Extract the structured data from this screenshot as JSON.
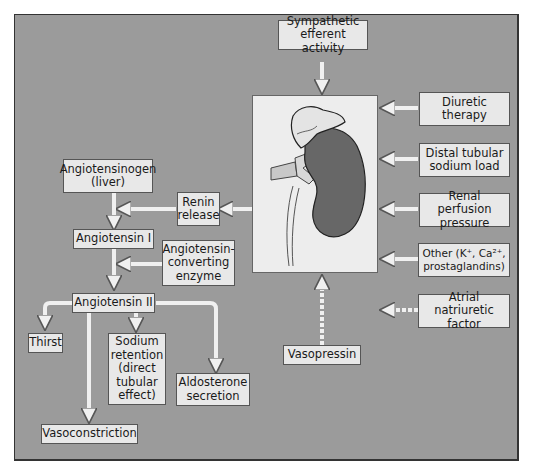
{
  "diagram": {
    "colors": {
      "background": "#9b9b9b",
      "box_fill": "#e8e8e8",
      "kidney_cortex": "#666666",
      "kidney_panel": "#ededed"
    },
    "nodes": {
      "sympathetic": "Sympathetic\nefferent activity",
      "diuretic": "Diuretic\ntherapy",
      "distal": "Distal tubular\nsodium load",
      "perfusion": "Renal perfusion\npressure",
      "other": "Other (K⁺, Ca²⁺,\nprostaglandins)",
      "anf": "Atrial natriuretic\nfactor",
      "vasopressin": "Vasopressin",
      "renin": "Renin\nrelease",
      "angiotensinogen": "Angiotensinogen\n(liver)",
      "ang1": "Angiotensin I",
      "ace": "Angiotensin-\nconverting\nenzyme",
      "ang2": "Angiotensin II",
      "thirst": "Thirst",
      "sodium": "Sodium\nretention\n(direct\ntubular\neffect)",
      "aldosterone": "Aldosterone\nsecretion",
      "vasoconstriction": "Vasoconstriction"
    },
    "edges": [
      {
        "from": "sympathetic",
        "to": "kidney",
        "style": "solid"
      },
      {
        "from": "diuretic",
        "to": "kidney",
        "style": "solid"
      },
      {
        "from": "distal",
        "to": "kidney",
        "style": "solid"
      },
      {
        "from": "perfusion",
        "to": "kidney",
        "style": "solid"
      },
      {
        "from": "other",
        "to": "kidney",
        "style": "solid"
      },
      {
        "from": "anf",
        "to": "kidney",
        "style": "dashed"
      },
      {
        "from": "vasopressin",
        "to": "kidney",
        "style": "dashed"
      },
      {
        "from": "kidney",
        "to": "renin",
        "style": "solid"
      },
      {
        "from": "renin",
        "to": "angiotensinogen-ang1",
        "style": "solid"
      },
      {
        "from": "angiotensinogen",
        "to": "ang1",
        "style": "solid"
      },
      {
        "from": "ace",
        "to": "ang1-ang2",
        "style": "solid"
      },
      {
        "from": "ang1",
        "to": "ang2",
        "style": "solid"
      },
      {
        "from": "ang2",
        "to": "thirst",
        "style": "solid"
      },
      {
        "from": "ang2",
        "to": "sodium",
        "style": "solid"
      },
      {
        "from": "ang2",
        "to": "aldosterone",
        "style": "solid"
      },
      {
        "from": "ang2",
        "to": "vasoconstriction",
        "style": "solid"
      }
    ]
  }
}
